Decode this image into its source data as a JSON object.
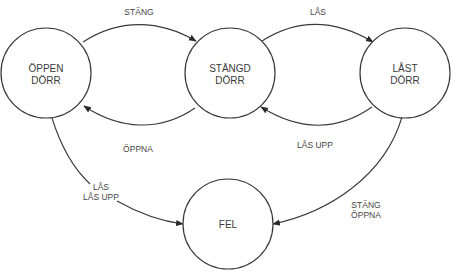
{
  "diagram": {
    "type": "state-machine",
    "nodes": [
      {
        "id": "open",
        "line1": "ÖPPEN",
        "line2": "DÖRR",
        "cx": 46,
        "cy": 73,
        "r": 45
      },
      {
        "id": "closed",
        "line1": "STÄNGD",
        "line2": "DÖRR",
        "cx": 230,
        "cy": 73,
        "r": 45
      },
      {
        "id": "locked",
        "line1": "LÅST",
        "line2": "DÖRR",
        "cx": 405,
        "cy": 73,
        "r": 45
      },
      {
        "id": "error",
        "line1": "FEL",
        "line2": "",
        "cx": 228,
        "cy": 224,
        "r": 45
      }
    ],
    "edges": [
      {
        "from": "open",
        "to": "closed",
        "label1": "STÄNG",
        "label2": ""
      },
      {
        "from": "closed",
        "to": "open",
        "label1": "ÖPPNA",
        "label2": ""
      },
      {
        "from": "closed",
        "to": "locked",
        "label1": "LÅS",
        "label2": ""
      },
      {
        "from": "locked",
        "to": "closed",
        "label1": "LÅS UPP",
        "label2": ""
      },
      {
        "from": "open",
        "to": "error",
        "label1": "LÅS",
        "label2": "LÅS UPP"
      },
      {
        "from": "locked",
        "to": "error",
        "label1": "STÄNG",
        "label2": "ÖPPNA"
      }
    ],
    "colors": {
      "stroke": "#3a3a3a",
      "text": "#444444",
      "background": "#ffffff"
    }
  }
}
